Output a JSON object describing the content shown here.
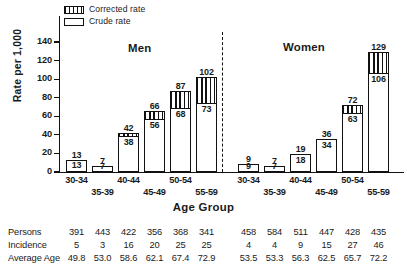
{
  "chart_data": {
    "type": "bar",
    "title": "",
    "xlabel": "Age Group",
    "ylabel": "Rate per 1,000",
    "ylim": [
      0,
      150
    ],
    "yticks": [
      0,
      20,
      40,
      60,
      80,
      100,
      120,
      140
    ],
    "grid": false,
    "legend_position": "top-left",
    "panels": [
      {
        "name": "Men",
        "label": "Men"
      },
      {
        "name": "Women",
        "label": "Women"
      }
    ],
    "categories": [
      "30-34",
      "35-39",
      "40-44",
      "45-49",
      "50-54",
      "55-59"
    ],
    "legend": [
      {
        "key": "corrected",
        "label": "Corrected rate",
        "pattern": "vertical-hatch"
      },
      {
        "key": "crude",
        "label": "Crude rate",
        "pattern": "open"
      }
    ],
    "series": [
      {
        "name": "Corrected rate",
        "panel": "Men",
        "values": [
          13,
          7,
          42,
          66,
          87,
          102
        ]
      },
      {
        "name": "Crude rate",
        "panel": "Men",
        "values": [
          13,
          7,
          38,
          56,
          68,
          73
        ]
      },
      {
        "name": "Corrected rate",
        "panel": "Women",
        "values": [
          9,
          7,
          19,
          36,
          72,
          129
        ]
      },
      {
        "name": "Crude rate",
        "panel": "Women",
        "values": [
          9,
          7,
          18,
          34,
          63,
          106
        ]
      }
    ],
    "bars": [
      {
        "panel": "Men",
        "category": "30-34",
        "corrected": 13,
        "crude": 13,
        "x": 66
      },
      {
        "panel": "Men",
        "category": "35-39",
        "corrected": 7,
        "crude": 7,
        "x": 92
      },
      {
        "panel": "Men",
        "category": "40-44",
        "corrected": 42,
        "crude": 38,
        "x": 118
      },
      {
        "panel": "Men",
        "category": "45-49",
        "corrected": 66,
        "crude": 56,
        "x": 144
      },
      {
        "panel": "Men",
        "category": "50-54",
        "corrected": 87,
        "crude": 68,
        "x": 170
      },
      {
        "panel": "Men",
        "category": "55-59",
        "corrected": 102,
        "crude": 73,
        "x": 196
      },
      {
        "panel": "Women",
        "category": "30-34",
        "corrected": 9,
        "crude": 9,
        "x": 238
      },
      {
        "panel": "Women",
        "category": "35-39",
        "corrected": 7,
        "crude": 7,
        "x": 264
      },
      {
        "panel": "Women",
        "category": "40-44",
        "corrected": 19,
        "crude": 18,
        "x": 290
      },
      {
        "panel": "Women",
        "category": "45-49",
        "corrected": 36,
        "crude": 34,
        "x": 316
      },
      {
        "panel": "Women",
        "category": "50-54",
        "corrected": 72,
        "crude": 63,
        "x": 342
      },
      {
        "panel": "Women",
        "category": "55-59",
        "corrected": 129,
        "crude": 106,
        "x": 368
      }
    ],
    "table": {
      "rows": [
        {
          "label": "Persons",
          "values": [
            "391",
            "443",
            "422",
            "356",
            "368",
            "341",
            "458",
            "584",
            "511",
            "447",
            "428",
            "435"
          ]
        },
        {
          "label": "Incidence",
          "values": [
            "5",
            "3",
            "16",
            "20",
            "25",
            "25",
            "4",
            "4",
            "9",
            "15",
            "27",
            "46"
          ]
        },
        {
          "label": "Average Age",
          "values": [
            "49.8",
            "53.0",
            "58.6",
            "62.1",
            "67.4",
            "72.9",
            "53.5",
            "53.3",
            "56.3",
            "62.5",
            "65.7",
            "72.2"
          ]
        }
      ]
    },
    "colors": {
      "ink": "#111111",
      "background": "#ffffff"
    }
  }
}
